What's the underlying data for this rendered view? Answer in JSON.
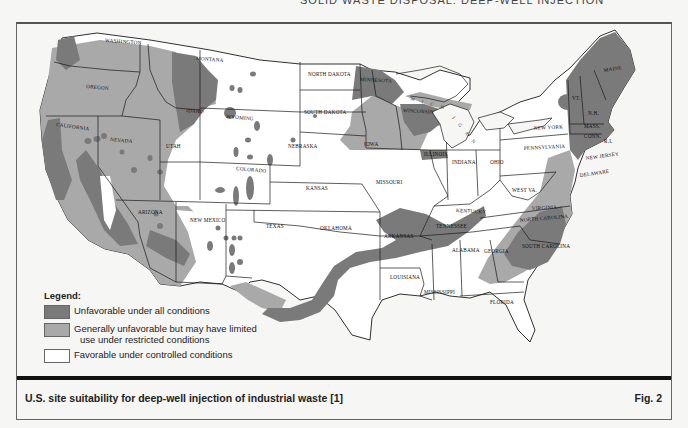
{
  "running_head": "SOLID WASTE DISPOSAL: DEEP-WELL INJECTION",
  "colors": {
    "unfavorable": "#7a7a7a",
    "limited": "#a9a9a9",
    "favorable": "#ffffff",
    "border": "#1a1a1a",
    "background": "#f6f6f4",
    "water": "#f6f6f4"
  },
  "legend": {
    "title": "Legend:",
    "items": [
      {
        "key": "unfavorable",
        "label": "Unfavorable under all conditions",
        "label2": ""
      },
      {
        "key": "limited",
        "label": "Generally unfavorable but may have limited",
        "label2": "use under restricted conditions"
      },
      {
        "key": "favorable",
        "label": "Favorable under controlled conditions",
        "label2": ""
      }
    ]
  },
  "caption": {
    "text": "U.S. site suitability for deep-well injection of industrial waste [1]",
    "figure_number": "Fig. 2"
  },
  "map": {
    "lake_labels": [
      {
        "text": "M I C H",
        "x": 410,
        "y": 100,
        "rotate": 15
      },
      {
        "text": "I G A N",
        "x": 455,
        "y": 120,
        "rotate": 50
      }
    ],
    "state_labels": [
      {
        "text": "WASHINGTON",
        "x": 105,
        "y": 42,
        "rotate": 4
      },
      {
        "text": "OREGON",
        "x": 97,
        "y": 88,
        "rotate": 5
      },
      {
        "text": "IDAHO",
        "x": 186,
        "y": 112,
        "rotate": 4
      },
      {
        "text": "MONTANA",
        "x": 196,
        "y": 60,
        "rotate": 4
      },
      {
        "text": "WYOMING",
        "x": 232,
        "y": 118,
        "rotate": 5
      },
      {
        "text": "NORTH DAKOTA",
        "x": 318,
        "y": 74,
        "rotate": 0
      },
      {
        "text": "SOUTH DAKOTA",
        "x": 293,
        "y": 114,
        "rotate": 0
      },
      {
        "text": "MINNESOTA",
        "x": 360,
        "y": 81,
        "rotate": 3
      },
      {
        "text": "WISCONSIN",
        "x": 403,
        "y": 112,
        "rotate": 3
      },
      {
        "text": "CALIFORNIA",
        "x": 60,
        "y": 126,
        "rotate": 8
      },
      {
        "text": "NEVADA",
        "x": 111,
        "y": 141,
        "rotate": 5
      },
      {
        "text": "UTAH",
        "x": 152,
        "y": 148,
        "rotate": 0
      },
      {
        "text": "COLORADO",
        "x": 239,
        "y": 170,
        "rotate": 5
      },
      {
        "text": "NEBRASKA",
        "x": 290,
        "y": 149,
        "rotate": 0
      },
      {
        "text": "IOWA",
        "x": 365,
        "y": 146,
        "rotate": 0
      },
      {
        "text": "ILLINOIS",
        "x": 426,
        "y": 157,
        "rotate": 0
      },
      {
        "text": "INDIANA",
        "x": 451,
        "y": 164,
        "rotate": 0
      },
      {
        "text": "OHIO",
        "x": 494,
        "y": 164,
        "rotate": 0
      },
      {
        "text": "PENNSYLVANIA",
        "x": 547,
        "y": 149,
        "rotate": -3
      },
      {
        "text": "NEW YORK",
        "x": 555,
        "y": 127,
        "rotate": -3
      },
      {
        "text": "MAINE",
        "x": 614,
        "y": 71,
        "rotate": -10
      },
      {
        "text": "VT.",
        "x": 583,
        "y": 96,
        "rotate": 0
      },
      {
        "text": "N.H.",
        "x": 595,
        "y": 115,
        "rotate": 0
      },
      {
        "text": "MASS.",
        "x": 589,
        "y": 127,
        "rotate": 0
      },
      {
        "text": "CONN.",
        "x": 589,
        "y": 138,
        "rotate": 0
      },
      {
        "text": "R.I.",
        "x": 606,
        "y": 142,
        "rotate": 0
      },
      {
        "text": "NEW JERSEY",
        "x": 588,
        "y": 158,
        "rotate": -8
      },
      {
        "text": "DELAWARE",
        "x": 581,
        "y": 177,
        "rotate": -8
      },
      {
        "text": "KANSAS",
        "x": 311,
        "y": 183,
        "rotate": 0
      },
      {
        "text": "MISSOURI",
        "x": 382,
        "y": 181,
        "rotate": 0
      },
      {
        "text": "KENTUCKY",
        "x": 458,
        "y": 210,
        "rotate": 3
      },
      {
        "text": "WEST VA.",
        "x": 515,
        "y": 190,
        "rotate": 0
      },
      {
        "text": "VIRGINIA",
        "x": 543,
        "y": 210,
        "rotate": -3
      },
      {
        "text": "NORTH CAROLINA",
        "x": 544,
        "y": 221,
        "rotate": -5
      },
      {
        "text": "SOUTH CAROLINA",
        "x": 560,
        "y": 251,
        "rotate": 0
      },
      {
        "text": "TENNESSEE",
        "x": 440,
        "y": 227,
        "rotate": 0
      },
      {
        "text": "ARIZONA",
        "x": 123,
        "y": 218,
        "rotate": 0
      },
      {
        "text": "NEW MEXICO",
        "x": 200,
        "y": 222,
        "rotate": 0
      },
      {
        "text": "TEXAS",
        "x": 273,
        "y": 228,
        "rotate": 0
      },
      {
        "text": "OKLAHOMA",
        "x": 325,
        "y": 229,
        "rotate": 0
      },
      {
        "text": "ARKANSAS",
        "x": 388,
        "y": 236,
        "rotate": 0
      },
      {
        "text": "ALABAMA",
        "x": 460,
        "y": 251,
        "rotate": 0
      },
      {
        "text": "GEORGIA",
        "x": 494,
        "y": 253,
        "rotate": 0
      },
      {
        "text": "LOUISIANA",
        "x": 395,
        "y": 278,
        "rotate": 0
      },
      {
        "text": "MISSISSIPPI",
        "x": 446,
        "y": 294,
        "rotate": 0
      },
      {
        "text": "FLORIDA",
        "x": 493,
        "y": 303,
        "rotate": 0
      }
    ]
  }
}
